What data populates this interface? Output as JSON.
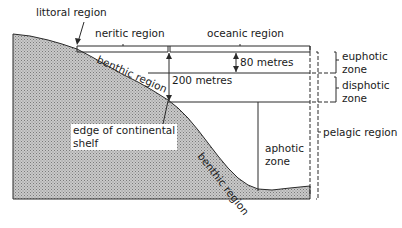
{
  "diagram": {
    "colors": {
      "line": "#2a2a2a",
      "land_fill": "#b8b8b8",
      "background": "#ffffff"
    },
    "labels": {
      "littoral": "littoral region",
      "neritic": "neritic region",
      "oceanic": "oceanic region",
      "benthic_upper": "benthic region",
      "benthic_lower": "benthic region",
      "depth_80": "80 metres",
      "depth_200": "200 metres",
      "shelf_edge_line1": "edge of continental",
      "shelf_edge_line2": "shelf",
      "euphotic_line1": "euphotic",
      "euphotic_line2": "zone",
      "disphotic_line1": "disphotic",
      "disphotic_line2": "zone",
      "aphotic_line1": "aphotic",
      "aphotic_line2": "zone",
      "pelagic": "pelagic region"
    }
  }
}
